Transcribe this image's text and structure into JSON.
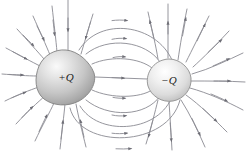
{
  "figure": {
    "type": "physics-diagram",
    "background_color": "#ffffff",
    "width": 247,
    "height": 152
  },
  "charges": [
    {
      "id": "positive-charge",
      "label": "+Q",
      "sign": "positive",
      "center_x": 66,
      "center_y": 77,
      "radius_x": 29,
      "radius_y": 26,
      "fill_light": "#f2f2f2",
      "fill_mid": "#c9c9c9",
      "fill_dark": "#9a9a9a",
      "outline_color": "#7d7d7d"
    },
    {
      "id": "negative-charge",
      "label": "−Q",
      "sign": "negative",
      "center_x": 169,
      "center_y": 80,
      "radius_x": 22,
      "radius_y": 21,
      "fill_light": "#fbfbfb",
      "fill_mid": "#e0e0e0",
      "fill_dark": "#b5b5b5",
      "outline_color": "#8c8c8c"
    }
  ],
  "field_lines": {
    "stroke_color": "#8a8a92",
    "stroke_width": 0.9,
    "arrow_color": "#6e6e76",
    "inner_line_count": 9,
    "outer_line_count": 18,
    "direction_note": "arrows point from +Q toward −Q"
  },
  "labels": {
    "positive": "+Q",
    "negative": "−Q"
  }
}
